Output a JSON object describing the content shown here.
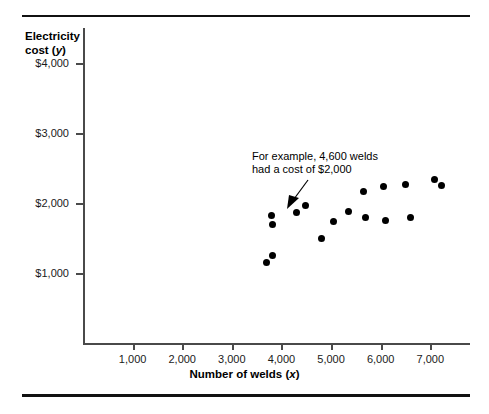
{
  "chart_data": {
    "type": "scatter",
    "title": "",
    "xlabel": "Number of welds (x)",
    "ylabel": "Electricity cost (y)",
    "xlim": [
      0,
      7800
    ],
    "ylim": [
      0,
      4500
    ],
    "xticks": [
      "1,000",
      "2,000",
      "3,000",
      "4,000",
      "5,000",
      "6,000",
      "7,000"
    ],
    "xtick_values": [
      1000,
      2000,
      3000,
      4000,
      5000,
      6000,
      7000
    ],
    "yticks": [
      "$1,000",
      "$2,000",
      "$3,000",
      "$4,000"
    ],
    "ytick_values": [
      1000,
      2000,
      3000,
      4000
    ],
    "grid": false,
    "legend": null,
    "marker_color": "#000000",
    "points": [
      {
        "x": 3700,
        "y": 1150
      },
      {
        "x": 3820,
        "y": 1250
      },
      {
        "x": 3800,
        "y": 1820
      },
      {
        "x": 3820,
        "y": 1700
      },
      {
        "x": 4300,
        "y": 1870
      },
      {
        "x": 4480,
        "y": 1960
      },
      {
        "x": 4800,
        "y": 1500
      },
      {
        "x": 5050,
        "y": 1740
      },
      {
        "x": 5350,
        "y": 1880
      },
      {
        "x": 5650,
        "y": 2160
      },
      {
        "x": 5700,
        "y": 1790
      },
      {
        "x": 6050,
        "y": 2230
      },
      {
        "x": 6100,
        "y": 1750
      },
      {
        "x": 6500,
        "y": 2260
      },
      {
        "x": 6600,
        "y": 1800
      },
      {
        "x": 7080,
        "y": 2330
      },
      {
        "x": 7230,
        "y": 2250
      }
    ],
    "annotations": [
      {
        "text_line1": "For example, 4,600 welds",
        "text_line2": "had a cost of $2,000",
        "points_to_x": 4600,
        "points_to_y": 2000
      }
    ]
  }
}
